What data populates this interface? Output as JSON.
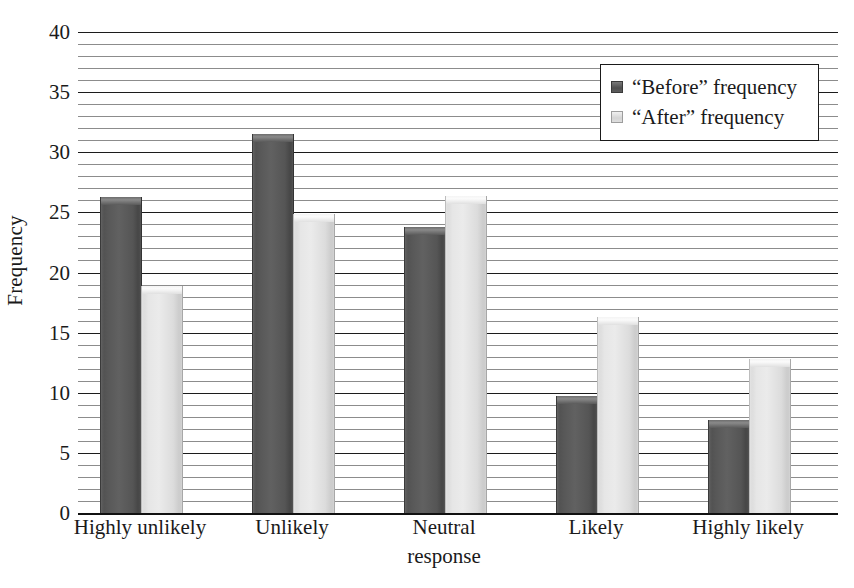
{
  "chart_data": {
    "type": "bar",
    "title": "",
    "subtitle": "",
    "xlabel": "response",
    "ylabel": "Frequency",
    "categories": [
      "Highly unlikely",
      "Unlikely",
      "Neutral",
      "Likely",
      "Highly likely"
    ],
    "series": [
      {
        "name": "“Before” frequency",
        "values": [
          26.3,
          31.5,
          23.8,
          9.7,
          7.7
        ],
        "color": "#585858"
      },
      {
        "name": "“After” frequency",
        "values": [
          18.9,
          24.9,
          26.4,
          16.3,
          12.8
        ],
        "color": "#e0e0e0"
      }
    ],
    "ylim": [
      0,
      40
    ],
    "y_major_ticks": [
      0,
      5,
      10,
      15,
      20,
      25,
      30,
      35,
      40
    ],
    "y_major_tick_labels": [
      "0",
      "5",
      "10",
      "15",
      "20",
      "25",
      "30",
      "35",
      "40"
    ],
    "y_minor_tick_step": 1,
    "grid": true,
    "grid_axis": "y",
    "legend_position": "upper right"
  },
  "legend": {
    "entries": [
      {
        "label": "“Before” frequency",
        "swatch": "before-swatch"
      },
      {
        "label": "“After” frequency",
        "swatch": "after-swatch"
      }
    ]
  },
  "axes": {
    "y_title": "Frequency",
    "x_title": "response"
  }
}
